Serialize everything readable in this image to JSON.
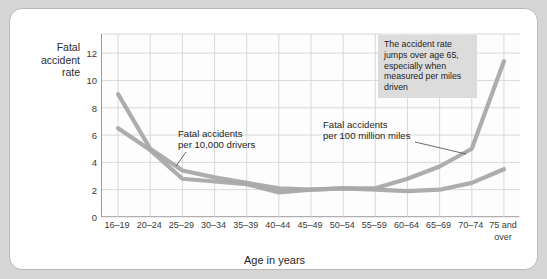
{
  "chart_data": {
    "type": "line",
    "title": "",
    "xlabel": "Age in years",
    "ylabel": "Fatal accident rate",
    "ylabel_lines": [
      "Fatal",
      "accident",
      "rate"
    ],
    "categories": [
      "16–19",
      "20–24",
      "25–29",
      "30–34",
      "35–39",
      "40–44",
      "45–49",
      "50–54",
      "55–59",
      "60–64",
      "65–69",
      "70–74",
      "75 and\nover"
    ],
    "ylim": [
      0,
      13.4
    ],
    "yticks": [
      0,
      2,
      4,
      6,
      8,
      10,
      12
    ],
    "ytick_labels": [
      "0",
      "2",
      "4",
      "6",
      "8",
      "10",
      "12"
    ],
    "grid": true,
    "legend_position": "inline-annotations",
    "series": [
      {
        "name": "Fatal accidents per 100 million miles",
        "color": "#a9a9a9",
        "values": [
          9.0,
          5.0,
          3.4,
          2.9,
          2.5,
          2.1,
          2.0,
          2.1,
          2.1,
          2.8,
          3.7,
          5.0,
          11.4
        ]
      },
      {
        "name": "Fatal accidents per 10,000 drivers",
        "color": "#a9a9a9",
        "values": [
          6.5,
          4.9,
          2.8,
          2.6,
          2.4,
          1.8,
          2.0,
          2.1,
          2.0,
          1.9,
          2.0,
          2.5,
          3.5
        ]
      }
    ],
    "annotations": [
      {
        "id": "label-drivers",
        "text": "Fatal accidents\nper 10,000 drivers",
        "points_to": "25–29 on drivers line"
      },
      {
        "id": "label-miles",
        "text": "Fatal accidents\nper 100 million miles",
        "points_to": "70–74 on miles line"
      },
      {
        "id": "callout-box",
        "text": "The accident rate jumps over age 65, especially when measured per miles driven",
        "background": "#dcdcdc"
      }
    ]
  },
  "colors": {
    "page_background": "#d6d6d6",
    "card_background": "#ffffff",
    "card_border": "#b9b9b9",
    "axis": "#9a9a9a",
    "grid": "#cfcfcf",
    "series": "#a9a9a9",
    "callout_background": "#dcdcdc",
    "text": "#1f1f1f"
  }
}
